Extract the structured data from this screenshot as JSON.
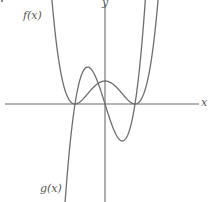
{
  "chart_data": {
    "type": "line",
    "title": "",
    "xlabel": "x",
    "ylabel": "y",
    "grid": false,
    "ticks": false,
    "series": [
      {
        "name": "f(x)",
        "label": "f(x)",
        "description": "quartic with double roots at x=-1 and x=1, local max at x=0",
        "points": [
          {
            "x": -1.9,
            "y": 3.0
          },
          {
            "x": -1.5,
            "y": 1.25
          },
          {
            "x": -1.0,
            "y": 0.0
          },
          {
            "x": -0.5,
            "y": 0.45
          },
          {
            "x": 0.0,
            "y": 0.8
          },
          {
            "x": 0.5,
            "y": 0.45
          },
          {
            "x": 1.0,
            "y": 0.0
          },
          {
            "x": 1.5,
            "y": 1.25
          },
          {
            "x": 1.9,
            "y": 3.0
          }
        ]
      },
      {
        "name": "g(x)",
        "label": "g(x)",
        "description": "cubic with roots at x=-1, 0, 1; local max left of y-axis, local min right of y-axis",
        "points": [
          {
            "x": -1.4,
            "y": -3.1
          },
          {
            "x": -1.0,
            "y": 0.0
          },
          {
            "x": -0.58,
            "y": 1.2
          },
          {
            "x": 0.0,
            "y": 0.0
          },
          {
            "x": 0.58,
            "y": -1.2
          },
          {
            "x": 1.0,
            "y": 0.0
          },
          {
            "x": 1.4,
            "y": 3.1
          }
        ]
      }
    ],
    "roots_marked_on_x_axis": [
      -1,
      0,
      1
    ],
    "colors": {
      "curves": "#6e6e6e",
      "axes": "#6b6b6b",
      "labels": "#555555"
    }
  },
  "labels": {
    "x_axis": "x",
    "y_axis": "y",
    "f": "f(x)",
    "g": "g(x)"
  }
}
